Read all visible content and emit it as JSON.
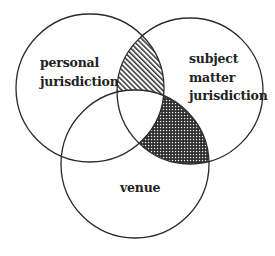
{
  "diagram": {
    "type": "venn",
    "sets": [
      {
        "id": "personal_jurisdiction",
        "label_lines": [
          "personal",
          "jurisdiction"
        ],
        "position": "upper-left"
      },
      {
        "id": "subject_matter_jurisdiction",
        "label_lines": [
          "subject",
          "matter",
          "jurisdiction"
        ],
        "position": "upper-right"
      },
      {
        "id": "venue",
        "label_lines": [
          "venue"
        ],
        "position": "bottom"
      }
    ],
    "shaded_regions": [
      {
        "sets": [
          "personal_jurisdiction",
          "subject_matter_jurisdiction"
        ],
        "excludes": [
          "venue"
        ],
        "pattern": "diagonal-hatch"
      },
      {
        "sets": [
          "subject_matter_jurisdiction",
          "venue"
        ],
        "excludes": [
          "personal_jurisdiction"
        ],
        "pattern": "dense-dot-crosshatch"
      }
    ],
    "colors": {
      "line": "#2a2a2a",
      "text": "#222222",
      "background": "#ffffff"
    }
  }
}
